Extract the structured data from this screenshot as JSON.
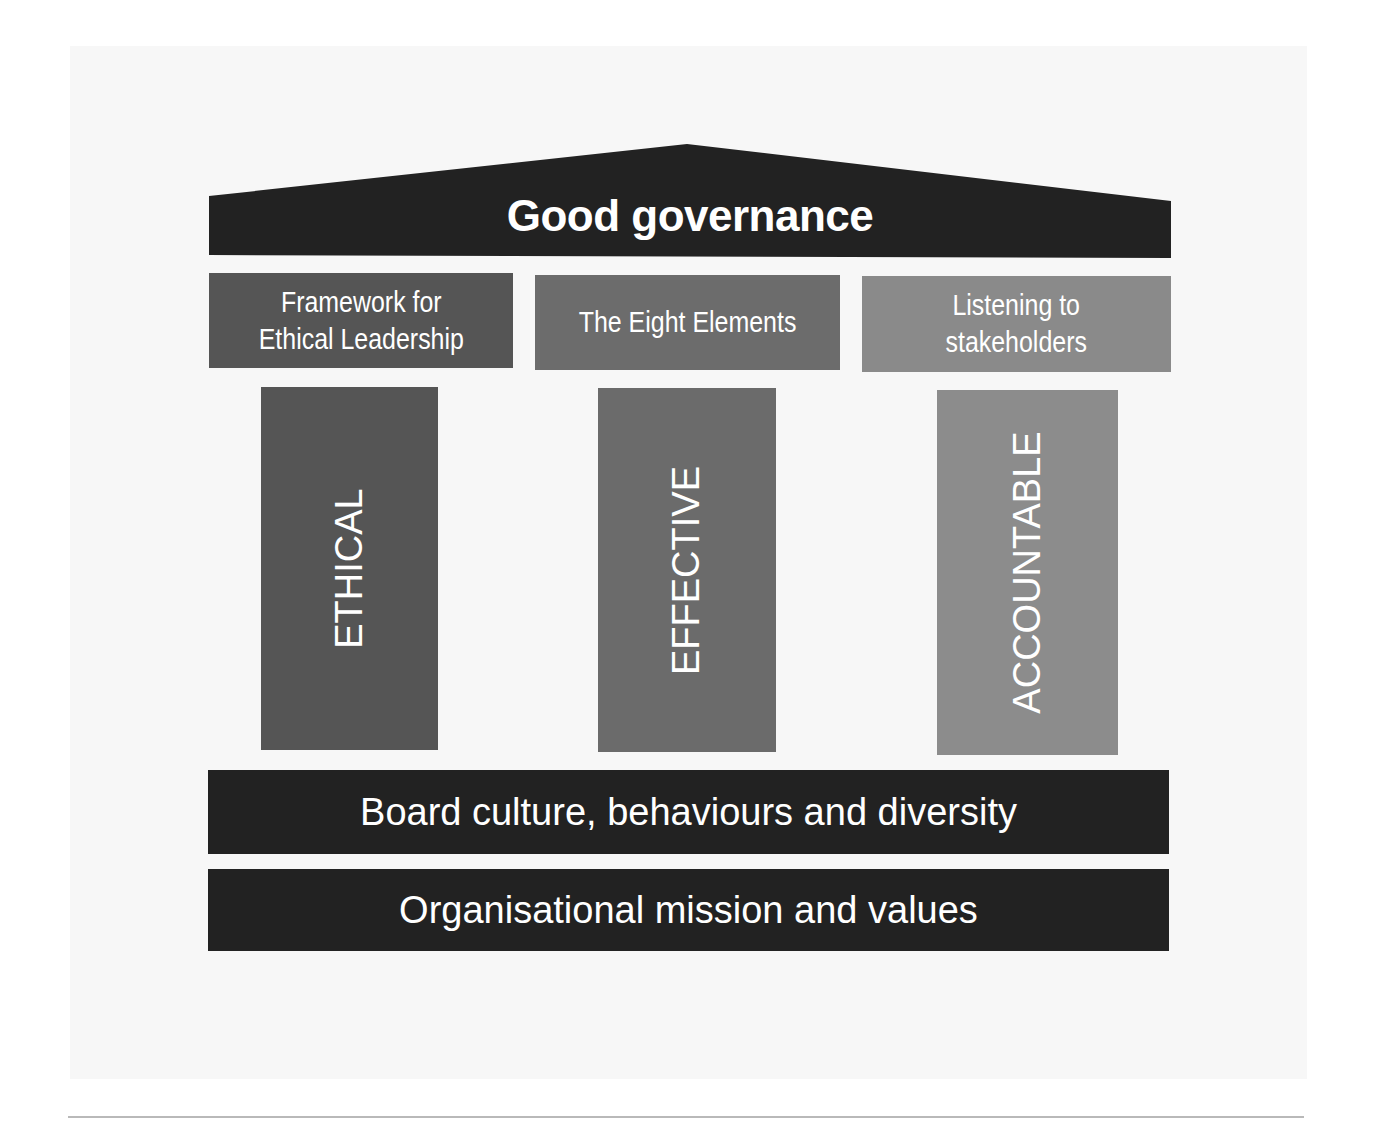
{
  "diagram": {
    "roof": {
      "title": "Good governance",
      "color": "#222222"
    },
    "frameworks": [
      {
        "label_line1": "Framework for",
        "label_line2": "Ethical Leadership",
        "color": "#555555"
      },
      {
        "label_line1": "The Eight Elements",
        "label_line2": "",
        "color": "#6c6c6c"
      },
      {
        "label_line1": "Listening to",
        "label_line2": "stakeholders",
        "color": "#8a8a8a"
      }
    ],
    "pillars": [
      {
        "label": "ETHICAL",
        "color": "#555555"
      },
      {
        "label": "EFFECTIVE",
        "color": "#6b6b6b"
      },
      {
        "label": "ACCOUNTABLE",
        "color": "#8c8c8c"
      }
    ],
    "foundations": [
      {
        "label": "Board culture, behaviours and diversity",
        "color": "#222222"
      },
      {
        "label": "Organisational mission and values",
        "color": "#222222"
      }
    ]
  }
}
